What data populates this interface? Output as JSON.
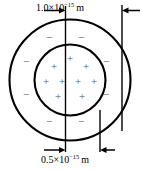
{
  "figure": {
    "name": "charge-distribution-diagram",
    "stroke_color": "#000000",
    "background_color": "#ffffff",
    "charge_symbol_color": "#555555"
  },
  "dimensions": {
    "outer": {
      "name": "outer-diameter",
      "mantissa": "1.0×10",
      "exponent": "−15",
      "unit": "m",
      "full_text": "1.0×10⁻¹⁵ m"
    },
    "inner": {
      "name": "inner-diameter",
      "mantissa": "0.5×10",
      "exponent": "−15",
      "unit": "m",
      "full_text": "0.5×10⁻¹⁵ m"
    }
  },
  "charges": {
    "positive_symbol": "+",
    "negative_symbol": "−",
    "positive_count": 9,
    "negative_count": 8,
    "positive_positions": [
      {
        "x": 70,
        "y": 59
      },
      {
        "x": 54,
        "y": 67
      },
      {
        "x": 86,
        "y": 67
      },
      {
        "x": 62,
        "y": 82
      },
      {
        "x": 78,
        "y": 82
      },
      {
        "x": 46,
        "y": 82
      },
      {
        "x": 94,
        "y": 82
      },
      {
        "x": 58,
        "y": 97
      },
      {
        "x": 82,
        "y": 97
      }
    ],
    "negative_positions": [
      {
        "x": 49,
        "y": 38
      },
      {
        "x": 81,
        "y": 38
      },
      {
        "x": 26,
        "y": 62
      },
      {
        "x": 105,
        "y": 62
      },
      {
        "x": 26,
        "y": 95
      },
      {
        "x": 105,
        "y": 95
      },
      {
        "x": 49,
        "y": 122
      },
      {
        "x": 81,
        "y": 122
      }
    ]
  },
  "geometry": {
    "center_x": 70,
    "center_y": 80,
    "outer_radius": 60,
    "inner_radius": 35
  }
}
